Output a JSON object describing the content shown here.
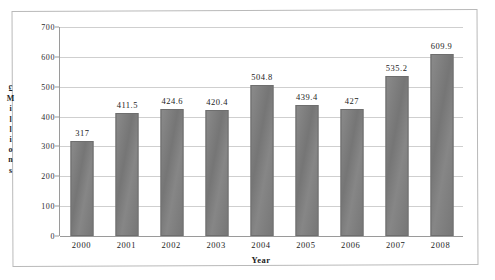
{
  "chart_data": {
    "type": "bar",
    "title": "",
    "subtitle": "",
    "xlabel": "Year",
    "ylabel": "£ Millions",
    "categories": [
      "2000",
      "2001",
      "2002",
      "2003",
      "2004",
      "2005",
      "2006",
      "2007",
      "2008"
    ],
    "values": [
      317,
      411.5,
      424.6,
      420.4,
      504.8,
      439.4,
      427,
      535.2,
      609.9
    ],
    "data_labels": [
      "317",
      "411.5",
      "424.6",
      "420.4",
      "504.8",
      "439.4",
      "427",
      "535.2",
      "609.9"
    ],
    "ylim": [
      0,
      700
    ],
    "yticks": [
      0,
      100,
      200,
      300,
      400,
      500,
      600,
      700
    ],
    "ytick_labels": [
      "0",
      "100",
      "200",
      "300",
      "400",
      "500",
      "600",
      "700"
    ],
    "grid": "horizontal",
    "legend": "none",
    "series": [
      {
        "name": "",
        "values": [
          317,
          411.5,
          424.6,
          420.4,
          504.8,
          439.4,
          427,
          535.2,
          609.9
        ]
      }
    ]
  },
  "axis": {
    "y_title_glyphs": [
      "£",
      "M",
      "i",
      "l",
      "l",
      "i",
      "o",
      "n",
      "s"
    ],
    "x_title": "Year"
  },
  "colors": {
    "bar_fill": "#7d7d7d",
    "bar_border": "#6e6e6e",
    "gridline": "#cfcfcf",
    "axis_line": "#9a9a9a",
    "frame": "#b9b9b9",
    "background": "#ffffff",
    "text": "#1c1c1c"
  }
}
